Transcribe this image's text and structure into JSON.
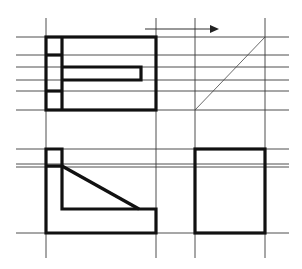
{
  "diagram": {
    "type": "orthographic-projection",
    "colors": {
      "background": "#ffffff",
      "outline": "#111111",
      "construction": "#3a3a3a"
    },
    "construction_lines": {
      "vertical_x": [
        46,
        156,
        195,
        265
      ],
      "top_horizontal_y": [
        37,
        55,
        67,
        80,
        91,
        110
      ],
      "bottom_horizontal_y": [
        149,
        164,
        167,
        233
      ]
    },
    "views": [
      {
        "name": "top-view",
        "position": "upper-left"
      },
      {
        "name": "front-view",
        "position": "lower-left"
      },
      {
        "name": "side-view",
        "position": "lower-right"
      }
    ],
    "miter_line": {
      "from": [
        195,
        110
      ],
      "to": [
        265,
        37
      ]
    },
    "arrow": {
      "direction": "right",
      "from": [
        145,
        29
      ],
      "to": [
        218,
        29
      ]
    }
  }
}
